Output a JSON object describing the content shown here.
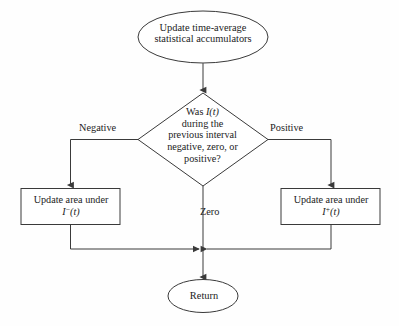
{
  "diagram": {
    "type": "flowchart",
    "background_color": "#fefefe",
    "stroke_color": "#3a3a3a",
    "text_color": "#1c1c1c",
    "nodes": {
      "start_ellipse": {
        "shape": "ellipse",
        "line1": "Update time-average",
        "line2": "statistical accumulators"
      },
      "decision_diamond": {
        "shape": "diamond",
        "line1_prefix": "Was ",
        "line1_symbol": "I(t)",
        "line2": "during the",
        "line3": "previous interval",
        "line4": "negative, zero, or",
        "line5": "positive?"
      },
      "left_process": {
        "shape": "rectangle",
        "line1": "Update area under",
        "symbol_base": "I",
        "symbol_sup": "−",
        "symbol_arg": "(t)"
      },
      "right_process": {
        "shape": "rectangle",
        "line1": "Update area under",
        "symbol_base": "I",
        "symbol_sup": "+",
        "symbol_arg": "(t)"
      },
      "end_ellipse": {
        "shape": "ellipse",
        "label": "Return"
      }
    },
    "edge_labels": {
      "left_branch": "Negative",
      "right_branch": "Positive",
      "center_branch": "Zero"
    }
  }
}
